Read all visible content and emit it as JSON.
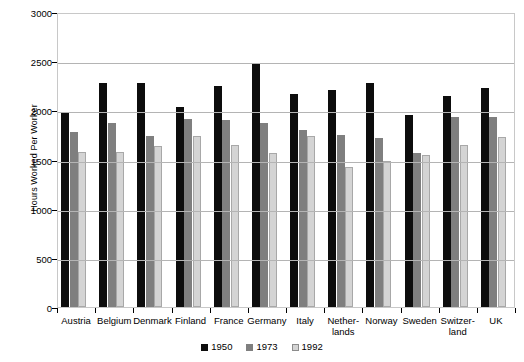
{
  "chart_data": {
    "type": "bar",
    "title": "",
    "xlabel": "",
    "ylabel": "Hours Worked Per Worker",
    "ylim": [
      0,
      3000
    ],
    "ytick_step": 500,
    "yticks": [
      0,
      500,
      1000,
      1500,
      2000,
      2500,
      3000
    ],
    "ytick_labels": [
      "0",
      "500",
      "1000",
      "1500",
      "2000",
      "2500",
      "3000"
    ],
    "grid": true,
    "legend_position": "bottom",
    "categories": [
      "Austria",
      "Belgium",
      "Denmark",
      "Finland",
      "France",
      "Germany",
      "Italy",
      "Nether-\nlands",
      "Norway",
      "Sweden",
      "Switzer-\nland",
      "UK"
    ],
    "series": [
      {
        "name": "1950",
        "color": "#0d0d0d",
        "values": [
          1976,
          2283,
          2283,
          2035,
          2252,
          2468,
          2167,
          2208,
          2283,
          1951,
          2144,
          2229
        ]
      },
      {
        "name": "1973",
        "color": "#7f7f7f",
        "values": [
          1778,
          1872,
          1742,
          1915,
          1904,
          1868,
          1800,
          1751,
          1721,
          1571,
          1930,
          1929
        ]
      },
      {
        "name": "1992",
        "color": "#d4d4d4",
        "values": [
          1576,
          1581,
          1639,
          1744,
          1650,
          1563,
          1742,
          1420,
          1480,
          1551,
          1650,
          1730
        ]
      }
    ]
  },
  "legend": {
    "entries": [
      {
        "label": "1950"
      },
      {
        "label": "1973"
      },
      {
        "label": "1992"
      }
    ]
  }
}
